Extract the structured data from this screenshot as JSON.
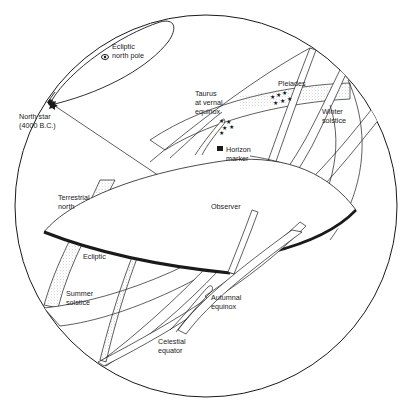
{
  "diagram": {
    "colors": {
      "ink": "#1a1a1a",
      "background": "#ffffff",
      "stipple": "#9a9a9a"
    },
    "labels": {
      "ecliptic_north_pole": [
        "Ecliptic",
        "north pole"
      ],
      "north_star": [
        "North star",
        "(4000 B.C.)"
      ],
      "taurus": [
        "Taurus",
        "at vernal",
        "equinox"
      ],
      "pleiades": [
        "Pleiades"
      ],
      "winter_solstice": [
        "Winter",
        "solstice"
      ],
      "horizon_marker": [
        "Horizon",
        "marker"
      ],
      "observer": [
        "Observer"
      ],
      "terrestrial_north": [
        "Terrestrial",
        "north"
      ],
      "ecliptic": [
        "Ecliptic"
      ],
      "summer_solstice": [
        "Summer",
        "solstice"
      ],
      "autumnal_equinox": [
        "Autumnal",
        "equinox"
      ],
      "celestial_equator": [
        "Celestial",
        "equator"
      ]
    },
    "elements": {
      "celestial_sphere": "outer circle",
      "horizon_plane": "ellipse with thick front rim",
      "ecliptic_band": "stippled band",
      "celestial_equator_band": "white band",
      "star_symbols": "Pleiades cluster and Taurus cluster"
    }
  }
}
